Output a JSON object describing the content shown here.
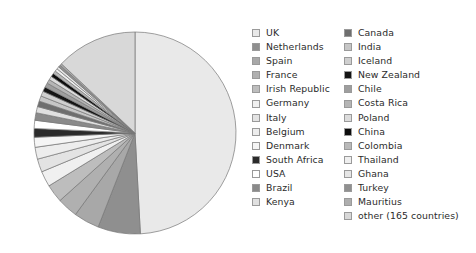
{
  "chart_data": {
    "type": "pie",
    "title": "",
    "subtitle": "",
    "legend_position": "right",
    "start_angle_deg": 0,
    "direction": "clockwise",
    "categories": [
      "UK",
      "Netherlands",
      "Spain",
      "France",
      "Irish Republic",
      "Germany",
      "Italy",
      "Belgium",
      "Denmark",
      "South Africa",
      "USA",
      "Brazil",
      "Kenya",
      "Canada",
      "India",
      "Iceland",
      "New Zealand",
      "Chile",
      "Costa Rica",
      "Poland",
      "China",
      "Colombia",
      "Thailand",
      "Ghana",
      "Turkey",
      "Mauritius",
      "other (165 countries)"
    ],
    "values": [
      49.2,
      6.8,
      4.1,
      3.3,
      2.9,
      2.5,
      2.1,
      1.9,
      1.6,
      1.4,
      1.3,
      1.2,
      1.0,
      0.9,
      0.85,
      0.8,
      0.75,
      0.7,
      0.65,
      0.6,
      0.55,
      0.5,
      0.45,
      0.4,
      0.35,
      0.3,
      13.0
    ],
    "colors": [
      "#e9e9e9",
      "#8f8f8f",
      "#a8a8a8",
      "#b0b0b0",
      "#bdbdbd",
      "#f0f0f0",
      "#e3e3e3",
      "#ededed",
      "#f5f5f5",
      "#2b2b2b",
      "#ffffff",
      "#8a8a8a",
      "#e0e0e0",
      "#6e6e6e",
      "#c6c6c6",
      "#cfcfcf",
      "#141414",
      "#9e9e9e",
      "#b5b5b5",
      "#dcdcdc",
      "#0d0d0d",
      "#b9b9b9",
      "#efefef",
      "#e6e6e6",
      "#909090",
      "#aeaeae",
      "#d8d8d8"
    ],
    "xlabel": "",
    "ylabel": ""
  },
  "legend": {
    "columns": [
      {
        "items": [
          {
            "label": "UK",
            "color": "#e9e9e9"
          },
          {
            "label": "Netherlands",
            "color": "#8f8f8f"
          },
          {
            "label": "Spain",
            "color": "#a8a8a8"
          },
          {
            "label": "France",
            "color": "#b0b0b0"
          },
          {
            "label": "Irish Republic",
            "color": "#bdbdbd"
          },
          {
            "label": "Germany",
            "color": "#f0f0f0"
          },
          {
            "label": "Italy",
            "color": "#e3e3e3"
          },
          {
            "label": "Belgium",
            "color": "#ededed"
          },
          {
            "label": "Denmark",
            "color": "#f5f5f5"
          },
          {
            "label": "South Africa",
            "color": "#2b2b2b"
          },
          {
            "label": "USA",
            "color": "#ffffff"
          },
          {
            "label": "Brazil",
            "color": "#8a8a8a"
          },
          {
            "label": "Kenya",
            "color": "#e0e0e0"
          }
        ]
      },
      {
        "items": [
          {
            "label": "Canada",
            "color": "#6e6e6e"
          },
          {
            "label": "India",
            "color": "#c6c6c6"
          },
          {
            "label": "Iceland",
            "color": "#cfcfcf"
          },
          {
            "label": "New Zealand",
            "color": "#141414"
          },
          {
            "label": "Chile",
            "color": "#9e9e9e"
          },
          {
            "label": "Costa Rica",
            "color": "#b5b5b5"
          },
          {
            "label": "Poland",
            "color": "#dcdcdc"
          },
          {
            "label": "China",
            "color": "#0d0d0d"
          },
          {
            "label": "Colombia",
            "color": "#b9b9b9"
          },
          {
            "label": "Thailand",
            "color": "#efefef"
          },
          {
            "label": "Ghana",
            "color": "#e6e6e6"
          },
          {
            "label": "Turkey",
            "color": "#909090"
          },
          {
            "label": "Mauritius",
            "color": "#aeaeae"
          },
          {
            "label": "other (165 countries)",
            "color": "#d8d8d8"
          }
        ]
      }
    ]
  },
  "pie": {
    "center_x": 105,
    "center_y": 106,
    "radius": 101,
    "stroke": "#777777",
    "stroke_width": 0.7
  }
}
